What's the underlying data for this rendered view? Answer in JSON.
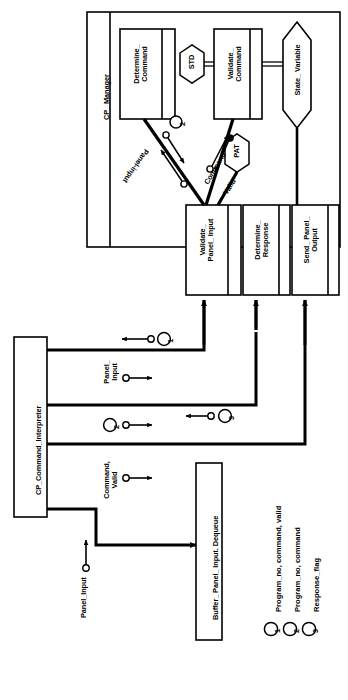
{
  "diagram": {
    "type": "software-architecture-structure-chart",
    "orientation": "rotated-90-ccw",
    "modules": {
      "cp_manager": {
        "label": "CP_ Manager"
      },
      "cp_command_interpreter": {
        "label": "CP_Command_Interpreter"
      }
    },
    "processes": [
      {
        "id": "determine_command",
        "label": "Determine_\nCommand"
      },
      {
        "id": "validate_command",
        "label": "Validate_\nCommand"
      },
      {
        "id": "validate_panel_input",
        "label": "Validate_\nPanel_ Input"
      },
      {
        "id": "determine_response",
        "label": "Determine_\nResponse"
      },
      {
        "id": "send_panel_output",
        "label": "Send_ Panel_\nOutput"
      }
    ],
    "control_specs": [
      {
        "id": "std",
        "label": "STD",
        "shape": "hexagon"
      },
      {
        "id": "pat",
        "label": "PAT",
        "shape": "hexagon"
      }
    ],
    "stores": [
      {
        "id": "state_variable",
        "label": "State_ Variable",
        "shape": "arrow-store"
      }
    ],
    "buffers": [
      {
        "id": "buffer_panel_input_dequeue",
        "label": "Buffer_ Panel_ Input. Dequeue"
      }
    ],
    "flow_labels": [
      {
        "id": "panel-input-diag",
        "label": "Panel-input"
      },
      {
        "id": "command-diag",
        "label": "Command"
      },
      {
        "id": "valid-diag",
        "label": "Valid"
      },
      {
        "id": "panel-input-vert",
        "label": "Panel_\nInput"
      },
      {
        "id": "command-valid",
        "label": "Command,\nValid"
      },
      {
        "id": "panel-input-src",
        "label": "Panel_Input"
      }
    ],
    "markers": [
      {
        "id": "marker-1-top",
        "label": "1"
      },
      {
        "id": "marker-2-diag",
        "label": "2"
      },
      {
        "id": "marker-2-mid",
        "label": "2"
      },
      {
        "id": "marker-3-mid",
        "label": "3"
      }
    ],
    "legend": {
      "items": [
        {
          "number": "1",
          "text": "Program_no, command, valid"
        },
        {
          "number": "2",
          "text": "Program_no, command"
        },
        {
          "number": "3",
          "text": "Response_flag"
        }
      ]
    },
    "colors": {
      "stroke": "#000000",
      "fill": "#ffffff",
      "background": "#ffffff"
    }
  }
}
